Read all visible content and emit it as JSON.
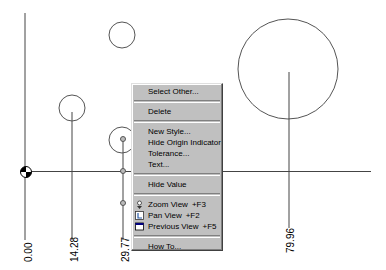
{
  "dimensions": {
    "labels": [
      "0.00",
      "14.28",
      "29.77",
      "79.96"
    ]
  },
  "context_menu": {
    "items": [
      {
        "label": "Select Other...",
        "underline": "O"
      },
      {
        "sep": true
      },
      {
        "label": "Delete",
        "underline": "D"
      },
      {
        "sep": true
      },
      {
        "label": "New Style..."
      },
      {
        "label": "Hide Origin Indicator"
      },
      {
        "label": "Tolerance..."
      },
      {
        "label": "Text..."
      },
      {
        "sep": true
      },
      {
        "label": "Hide Value"
      },
      {
        "sep": true
      },
      {
        "label": "Zoom View",
        "shortcut": "+F3",
        "icon": "zoom-icon"
      },
      {
        "label": "Pan View",
        "shortcut": "+F2",
        "icon": "pan-icon"
      },
      {
        "label": "Previous View",
        "shortcut": "+F5",
        "icon": "previous-view-icon"
      },
      {
        "sep": true
      },
      {
        "label": "How To..."
      }
    ],
    "select_other": "Select Other...",
    "delete": "Delete",
    "new_style": "New Style...",
    "hide_origin": "Hide Origin Indicator",
    "tolerance": "Tolerance...",
    "text": "Text...",
    "hide_value": "Hide Value",
    "zoom_view": "Zoom View",
    "zoom_shortcut": "+F3",
    "pan_view": "Pan View",
    "pan_shortcut": "+F2",
    "previous_view": "Previous View",
    "previous_shortcut": "+F5",
    "how_to": "How To..."
  },
  "colors": {
    "menu_bg": "#c0c0c0",
    "line": "#404040",
    "circle": "#555555"
  }
}
